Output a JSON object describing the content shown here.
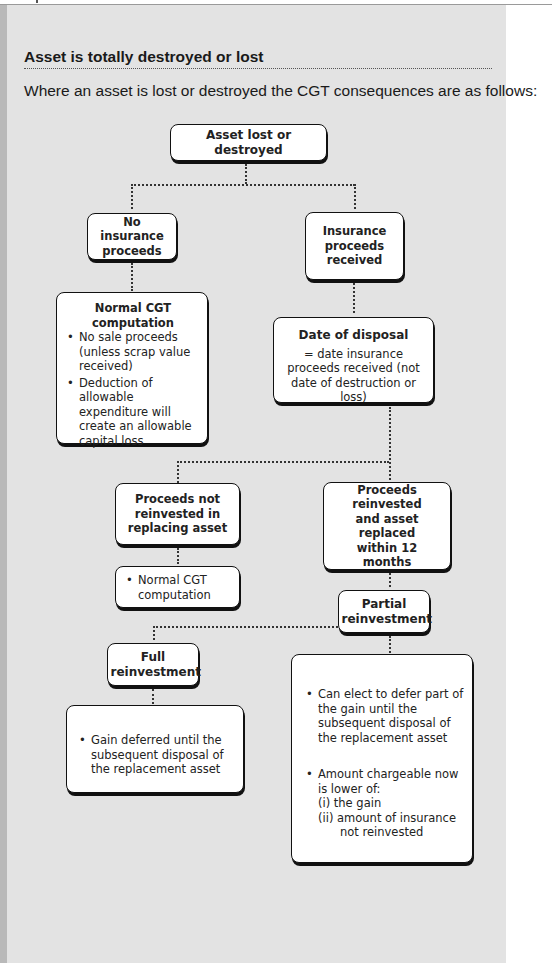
{
  "page": {
    "heading": "Asset is totally destroyed or lost",
    "intro": "Where an asset is lost or destroyed the CGT consequences are as follows:"
  },
  "diagram": {
    "root": "Asset lost or destroyed",
    "no_insurance": {
      "title": "No insurance proceeds",
      "result_title": "Normal CGT computation",
      "result_bullets": [
        "No sale proceeds (unless scrap value received)",
        "Deduction of allowable expenditure will create an allowable capital loss"
      ]
    },
    "insurance": {
      "title": "Insurance proceeds received",
      "date_title": "Date of disposal",
      "date_text": "= date insurance proceeds received (not date of destruction or loss)"
    },
    "not_reinvested": {
      "title": "Proceeds not reinvested in replacing asset",
      "bullet": "Normal CGT computation"
    },
    "reinvested": {
      "title": "Proceeds reinvested and asset replaced within 12 months"
    },
    "partial": {
      "title": "Partial reinvestment",
      "bullets": [
        "Can elect to defer part of the gain until the subsequent disposal of the replacement asset",
        "Amount chargeable now is lower of:"
      ],
      "options": [
        "(i)  the gain",
        "(ii) amount of insurance not reinvested"
      ]
    },
    "full": {
      "title": "Full reinvestment",
      "bullet": "Gain deferred until the subsequent  disposal of the replacement asset"
    }
  }
}
